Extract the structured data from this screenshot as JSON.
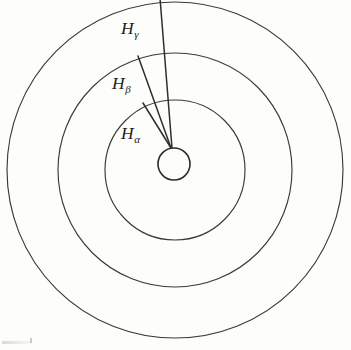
{
  "figure": {
    "background_color": "#fdfdfc",
    "line_color": "#3a3a38",
    "label_color": "#1d1d1b",
    "width": 351,
    "height": 350
  },
  "geometry": {
    "center": {
      "x": 175,
      "y": 170
    },
    "nucleus": {
      "cx": 174,
      "cy": 164,
      "r": 16
    },
    "orbits": [
      {
        "name": "orbit-n2",
        "r": 70
      },
      {
        "name": "orbit-n3",
        "r": 117
      },
      {
        "name": "orbit-n4",
        "r": 168
      }
    ],
    "convergence_point": {
      "x": 171,
      "y": 148
    },
    "transitions": [
      {
        "name": "alpha",
        "x1": 171,
        "y1": 148,
        "x2": 143,
        "y2": 103
      },
      {
        "name": "beta",
        "x1": 171,
        "y1": 148,
        "x2": 138,
        "y2": 56
      },
      {
        "name": "gamma",
        "x1": 172,
        "y1": 148,
        "x2": 160,
        "y2": -2
      }
    ]
  },
  "labels": {
    "alpha": {
      "main": "H",
      "sub": "α"
    },
    "beta": {
      "main": "H",
      "sub": "β"
    },
    "gamma": {
      "main": "H",
      "sub": "γ"
    }
  }
}
